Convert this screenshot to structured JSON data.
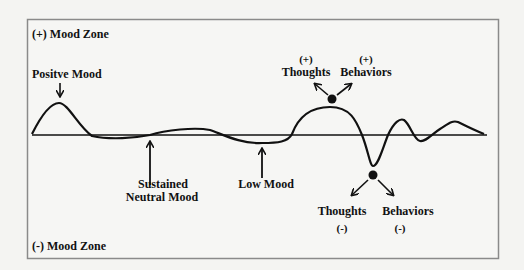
{
  "zones": {
    "positive": "(+) Mood Zone",
    "negative": "(-) Mood Zone"
  },
  "annotations": {
    "positive_mood": "Positve Mood",
    "sustained_line1": "Sustained",
    "sustained_line2": "Neutral Mood",
    "low_mood": "Low Mood",
    "pos_thoughts_sign": "(+)",
    "pos_thoughts": "Thoughts",
    "pos_behaviors_sign": "(+)",
    "pos_behaviors": "Behaviors",
    "neg_thoughts": "Thoughts",
    "neg_thoughts_sign": "(-)",
    "neg_behaviors": "Behaviors",
    "neg_behaviors_sign": "(-)"
  },
  "colors": {
    "background": "#f4f4f2",
    "frame": "#8a8a8a",
    "ink": "#111111"
  }
}
